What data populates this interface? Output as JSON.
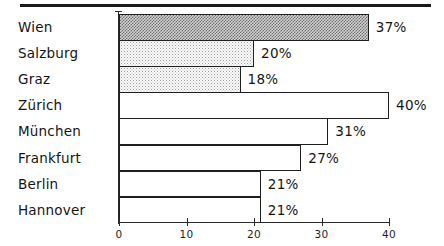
{
  "chart_data": {
    "type": "bar",
    "orientation": "horizontal",
    "title": "",
    "subtitle": "",
    "xlabel": "",
    "ylabel": "",
    "categories": [
      "Wien",
      "Salzburg",
      "Graz",
      "Zürich",
      "München",
      "Frankfurt",
      "Berlin",
      "Hannover"
    ],
    "values": [
      37,
      20,
      18,
      40,
      31,
      27,
      21,
      21
    ],
    "value_labels": [
      "37%",
      "20%",
      "18%",
      "40%",
      "31%",
      "27%",
      "21%",
      "21%"
    ],
    "xlim": [
      0,
      40
    ],
    "x_ticks": [
      0,
      10,
      20,
      30,
      40
    ],
    "x_tick_labels": [
      "0",
      "10",
      "20",
      "30",
      "40"
    ],
    "grid": false,
    "legend": "none",
    "bar_fills": [
      "dense-checker",
      "light-dots",
      "light-dots",
      "none",
      "none",
      "none",
      "none",
      "none"
    ],
    "colors": {
      "outline": "#1f1f1f",
      "axis": "#2a2a2a",
      "text": "#141414",
      "dense_fill": "#6d6d6d",
      "light_fill": "#b8b8b8",
      "plain_fill": "#ffffff",
      "rule": "#1a1a1a"
    }
  },
  "figure": {
    "top_rule_present": true
  }
}
